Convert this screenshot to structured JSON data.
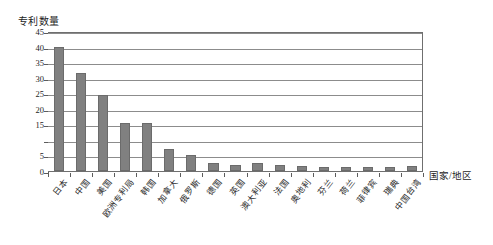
{
  "chart_data": {
    "type": "bar",
    "title": "",
    "subtitle": "",
    "ylabel": "专利数量",
    "xlabel": "国家/地区",
    "ylim": [
      0,
      45
    ],
    "ytick_step": 5,
    "yticks": [
      0,
      5,
      10,
      15,
      20,
      25,
      30,
      35,
      40,
      45
    ],
    "ytick_labels": [
      "0",
      "5",
      "",
      "15",
      "20",
      "25",
      "30",
      "35",
      "40",
      "45"
    ],
    "grid": true,
    "grid_axis": "y",
    "legend": false,
    "bar_color": "#808080",
    "bar_border_color": "#6b6b6b",
    "axis_color": "#5c5c5c",
    "grid_color": "#8c8c8c",
    "text_color": "#1d1d1d",
    "categories": [
      "日本",
      "中国",
      "美国",
      "欧洲专利局",
      "韩国",
      "加拿大",
      "俄罗斯",
      "德国",
      "英国",
      "澳大利亚",
      "法国",
      "奥地利",
      "芬兰",
      "荷兰",
      "菲律宾",
      "瑞典",
      "中国台湾"
    ],
    "values": [
      40,
      31.5,
      24.5,
      15.5,
      15.5,
      7,
      5,
      2.5,
      2,
      2.5,
      2,
      1.5,
      1.2,
      1.2,
      1.2,
      1.2,
      1.5
    ]
  }
}
